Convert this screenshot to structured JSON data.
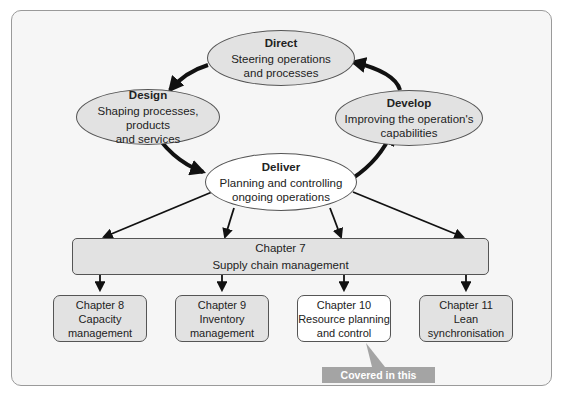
{
  "diagram": {
    "ellipses": [
      {
        "id": "direct",
        "title": "Direct",
        "line1": "Steering operations",
        "line2": "and processes"
      },
      {
        "id": "design",
        "title": "Design",
        "line1": "Shaping processes, products",
        "line2": "and services"
      },
      {
        "id": "develop",
        "title": "Develop",
        "line1": "Improving the operation's",
        "line2": "capabilities"
      },
      {
        "id": "deliver",
        "title": "Deliver",
        "line1": "Planning and controlling",
        "line2": "ongoing operations"
      }
    ],
    "chapter7": {
      "line1": "Chapter 7",
      "line2": "Supply chain management"
    },
    "chapters": [
      {
        "line1": "Chapter 8",
        "line2": "Capacity",
        "line3": "management",
        "highlight": false
      },
      {
        "line1": "Chapter 9",
        "line2": "Inventory",
        "line3": "management",
        "highlight": false
      },
      {
        "line1": "Chapter 10",
        "line2": "Resource planning",
        "line3": "and control",
        "highlight": true
      },
      {
        "line1": "Chapter 11",
        "line2": "Lean",
        "line3": "synchronisation",
        "highlight": false
      }
    ],
    "callout": "Covered in this chapter",
    "colors": {
      "fill_grey": "#e2e2e2",
      "fill_highlight": "#ffffff",
      "callout_bg": "#a4a4a4",
      "arrow": "#111111"
    }
  }
}
